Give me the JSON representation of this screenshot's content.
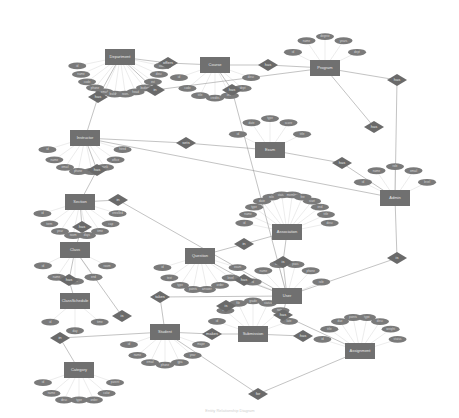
{
  "diagram": {
    "type": "er-diagram",
    "caption": "Entity Relationship Diagram",
    "entities": [
      {
        "id": "department",
        "label": "Department",
        "x": 120,
        "y": 57
      },
      {
        "id": "course",
        "label": "Course",
        "x": 215,
        "y": 65
      },
      {
        "id": "program",
        "label": "Program",
        "x": 325,
        "y": 68
      },
      {
        "id": "instructor",
        "label": "Instructor",
        "x": 85,
        "y": 138
      },
      {
        "id": "exam",
        "label": "Exam",
        "x": 270,
        "y": 150
      },
      {
        "id": "admin",
        "label": "Admin",
        "x": 395,
        "y": 198
      },
      {
        "id": "section",
        "label": "Section",
        "x": 80,
        "y": 202
      },
      {
        "id": "class",
        "label": "Class",
        "x": 75,
        "y": 250
      },
      {
        "id": "question",
        "label": "Question",
        "x": 200,
        "y": 256
      },
      {
        "id": "association",
        "label": "Association",
        "x": 287,
        "y": 232
      },
      {
        "id": "classschedule",
        "label": "ClassSchedule",
        "x": 75,
        "y": 301
      },
      {
        "id": "user",
        "label": "User",
        "x": 287,
        "y": 296
      },
      {
        "id": "student",
        "label": "Student",
        "x": 165,
        "y": 332
      },
      {
        "id": "submission",
        "label": "Submission",
        "x": 253,
        "y": 334
      },
      {
        "id": "assignment",
        "label": "Assignment",
        "x": 360,
        "y": 351
      },
      {
        "id": "category",
        "label": "Category",
        "x": 79,
        "y": 370
      }
    ],
    "relationships": [
      {
        "id": "r1",
        "label": "has",
        "x": 98,
        "y": 97
      },
      {
        "id": "r2",
        "label": "offers",
        "x": 168,
        "y": 63
      },
      {
        "id": "r3",
        "label": "has",
        "x": 268,
        "y": 65
      },
      {
        "id": "r4",
        "label": "in",
        "x": 155,
        "y": 90
      },
      {
        "id": "r5",
        "label": "has",
        "x": 232,
        "y": 90
      },
      {
        "id": "r6",
        "label": "has",
        "x": 397,
        "y": 80
      },
      {
        "id": "r7",
        "label": "sets",
        "x": 186,
        "y": 143
      },
      {
        "id": "r8",
        "label": "has",
        "x": 374,
        "y": 127
      },
      {
        "id": "r9",
        "label": "has",
        "x": 342,
        "y": 163
      },
      {
        "id": "r10",
        "label": "has",
        "x": 97,
        "y": 170
      },
      {
        "id": "r11",
        "label": "in",
        "x": 118,
        "y": 200
      },
      {
        "id": "r12",
        "label": "has",
        "x": 82,
        "y": 227
      },
      {
        "id": "r13",
        "label": "has",
        "x": 69,
        "y": 280
      },
      {
        "id": "r14",
        "label": "in",
        "x": 244,
        "y": 244
      },
      {
        "id": "r15",
        "label": "has",
        "x": 244,
        "y": 280
      },
      {
        "id": "r16",
        "label": "is",
        "x": 283,
        "y": 262
      },
      {
        "id": "r17",
        "label": "is",
        "x": 397,
        "y": 258
      },
      {
        "id": "r18",
        "label": "takes",
        "x": 160,
        "y": 297
      },
      {
        "id": "r19",
        "label": "is",
        "x": 122,
        "y": 316
      },
      {
        "id": "r20",
        "label": "is",
        "x": 226,
        "y": 306
      },
      {
        "id": "r21",
        "label": "makes",
        "x": 212,
        "y": 334
      },
      {
        "id": "r22",
        "label": "has",
        "x": 283,
        "y": 315
      },
      {
        "id": "r23",
        "label": "has",
        "x": 303,
        "y": 336
      },
      {
        "id": "r24",
        "label": "in",
        "x": 60,
        "y": 338
      },
      {
        "id": "r25",
        "label": "for",
        "x": 258,
        "y": 394
      }
    ],
    "attributes_per_entity": {
      "department": [
        "id",
        "name",
        "code",
        "phone",
        "email",
        "building",
        "room",
        "head",
        "budget",
        "est",
        "desc",
        "status"
      ],
      "course": [
        "id",
        "code",
        "title",
        "credits",
        "level",
        "dept",
        "desc"
      ],
      "program": [
        "id",
        "name",
        "degree",
        "years",
        "dept"
      ],
      "instructor": [
        "id",
        "name",
        "email",
        "phone",
        "title",
        "rank",
        "office",
        "hired"
      ],
      "exam": [
        "id",
        "date",
        "type",
        "score",
        "title"
      ],
      "admin": [
        "id",
        "name",
        "role",
        "email",
        "level"
      ],
      "section": [
        "id",
        "term",
        "year",
        "room",
        "days",
        "time",
        "cap",
        "enrolled"
      ],
      "class": [
        "id",
        "name",
        "start",
        "end",
        "room"
      ],
      "classschedule": [
        "id",
        "day",
        "time"
      ],
      "question": [
        "id",
        "text",
        "type",
        "points",
        "answer",
        "order",
        "level",
        "exam"
      ],
      "association": [
        "id",
        "name",
        "type",
        "date",
        "role",
        "status",
        "member",
        "fee",
        "start",
        "end",
        "title",
        "desc"
      ],
      "user": [
        "id",
        "name",
        "email",
        "pass",
        "phone",
        "role"
      ],
      "student": [
        "id",
        "name",
        "email",
        "phone",
        "gpa",
        "year",
        "major"
      ],
      "submission": [
        "id",
        "date",
        "file",
        "grade",
        "status",
        "notes",
        "late"
      ],
      "assignment": [
        "id",
        "title",
        "due",
        "points",
        "type",
        "desc",
        "weight",
        "status"
      ],
      "category": [
        "id",
        "name",
        "desc",
        "type",
        "order",
        "color",
        "parent"
      ]
    },
    "edges": [
      [
        "department",
        "r1"
      ],
      [
        "r1",
        "instructor"
      ],
      [
        "department",
        "r2"
      ],
      [
        "r2",
        "course"
      ],
      [
        "course",
        "r3"
      ],
      [
        "r3",
        "program"
      ],
      [
        "department",
        "r4"
      ],
      [
        "course",
        "r5"
      ],
      [
        "program",
        "r6"
      ],
      [
        "r6",
        "admin"
      ],
      [
        "instructor",
        "r7"
      ],
      [
        "r7",
        "exam"
      ],
      [
        "exam",
        "r9"
      ],
      [
        "r9",
        "admin"
      ],
      [
        "program",
        "r8"
      ],
      [
        "instructor",
        "r10"
      ],
      [
        "r10",
        "section"
      ],
      [
        "section",
        "r11"
      ],
      [
        "r11",
        "user"
      ],
      [
        "section",
        "r12"
      ],
      [
        "r12",
        "class"
      ],
      [
        "class",
        "r13"
      ],
      [
        "r13",
        "classschedule"
      ],
      [
        "question",
        "r14"
      ],
      [
        "r14",
        "association"
      ],
      [
        "question",
        "r15"
      ],
      [
        "r15",
        "user"
      ],
      [
        "association",
        "r16"
      ],
      [
        "r16",
        "user"
      ],
      [
        "admin",
        "r17"
      ],
      [
        "r17",
        "user"
      ],
      [
        "user",
        "r18"
      ],
      [
        "r18",
        "student"
      ],
      [
        "class",
        "r19"
      ],
      [
        "student",
        "r21"
      ],
      [
        "r21",
        "submission"
      ],
      [
        "user",
        "r22"
      ],
      [
        "r22",
        "assignment"
      ],
      [
        "submission",
        "r23"
      ],
      [
        "category",
        "r24"
      ],
      [
        "r24",
        "student"
      ],
      [
        "student",
        "r25"
      ],
      [
        "r25",
        "assignment"
      ],
      [
        "instructor",
        "admin"
      ],
      [
        "program",
        "r4"
      ],
      [
        "r5",
        "user"
      ]
    ]
  }
}
